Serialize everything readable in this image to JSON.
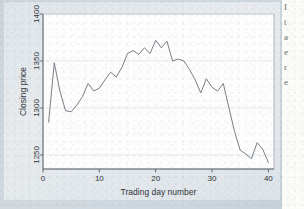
{
  "chart_data": {
    "type": "line",
    "title": "",
    "xlabel": "Trading day number",
    "ylabel": "Closing price",
    "xlim": [
      0,
      41
    ],
    "ylim": [
      1235,
      1400
    ],
    "xticks": [
      0,
      10,
      20,
      30,
      40
    ],
    "yticks": [
      1250,
      1300,
      1350,
      1400
    ],
    "xticklabels": [
      "0",
      "10",
      "20",
      "30",
      "40"
    ],
    "yticklabels": [
      "1250",
      "1300",
      "1350",
      "1400"
    ],
    "grid": "horizontal",
    "legend": "none",
    "line_color": "#6a7078",
    "series": [
      {
        "name": "Closing price",
        "x": [
          1,
          2,
          3,
          4,
          5,
          6,
          7,
          8,
          9,
          10,
          11,
          12,
          13,
          14,
          15,
          16,
          17,
          18,
          19,
          20,
          21,
          22,
          23,
          24,
          25,
          26,
          27,
          28,
          29,
          30,
          31,
          32,
          33,
          34,
          35,
          36,
          37,
          38,
          39,
          40
        ],
        "values": [
          1285,
          1348,
          1318,
          1297,
          1296,
          1303,
          1312,
          1326,
          1318,
          1321,
          1330,
          1338,
          1333,
          1343,
          1358,
          1361,
          1357,
          1364,
          1358,
          1372,
          1364,
          1371,
          1350,
          1352,
          1350,
          1341,
          1330,
          1316,
          1331,
          1322,
          1318,
          1326,
          1300,
          1275,
          1255,
          1251,
          1246,
          1263,
          1256,
          1242
        ]
      }
    ]
  },
  "figure": {
    "panel_bg": "#e7ebee",
    "page_bg": "#ccd5dc",
    "axis_color": "#5b6167",
    "grid_color": "#e0e6ea"
  },
  "document_text": {
    "lines": [
      "I",
      "t",
      "a",
      "e",
      "r",
      "e"
    ]
  }
}
